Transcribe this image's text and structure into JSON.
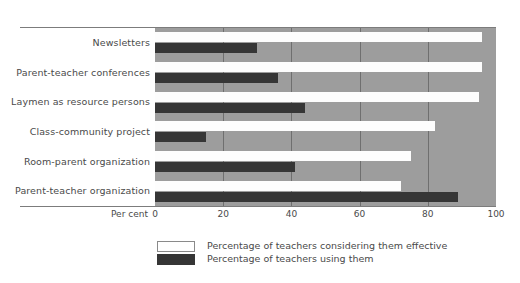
{
  "top_caption": "",
  "chart_data": {
    "type": "bar",
    "orientation": "horizontal",
    "title": "",
    "xlabel": "Per cent",
    "ylabel": "",
    "xlim": [
      0,
      100
    ],
    "xticks": [
      0,
      20,
      40,
      60,
      80,
      100
    ],
    "grid": true,
    "grid_axis": "x",
    "legend_position": "below",
    "categories": [
      "Newsletters",
      "Parent-teacher conferences",
      "Laymen as resource persons",
      "Class-community project",
      "Room-parent organization",
      "Parent-teacher organization"
    ],
    "series": [
      {
        "name": "Percentage of teachers considering them effective",
        "color": "#ffffff",
        "values": [
          96,
          96,
          95,
          82,
          75,
          72
        ]
      },
      {
        "name": "Percentage of teachers using them",
        "color": "#363636",
        "values": [
          30,
          36,
          44,
          15,
          41,
          89
        ]
      }
    ],
    "plot_background": "#9d9d9d"
  },
  "legend": [
    {
      "label": "Percentage of teachers considering them effective",
      "swatch": "light"
    },
    {
      "label": "Percentage of teachers using them",
      "swatch": "dark"
    }
  ]
}
